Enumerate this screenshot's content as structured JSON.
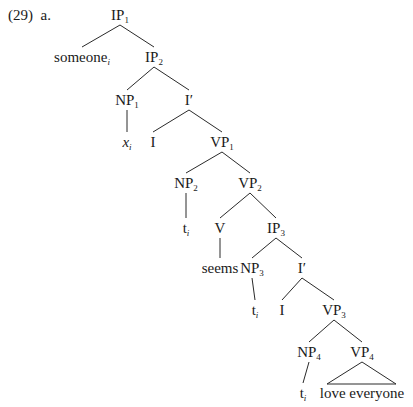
{
  "example": {
    "number": "(29)",
    "sub": "a."
  },
  "chart_data": {
    "type": "tree",
    "nodes": [
      {
        "id": "IP1",
        "cat": "IP",
        "sub": "1",
        "x": 120,
        "y": 15
      },
      {
        "id": "someone",
        "cat": "someone",
        "sub": "i",
        "sub_italic": true,
        "x": 82,
        "y": 57
      },
      {
        "id": "IP2",
        "cat": "IP",
        "sub": "2",
        "x": 154,
        "y": 57
      },
      {
        "id": "NP1",
        "cat": "NP",
        "sub": "1",
        "x": 127,
        "y": 100
      },
      {
        "id": "Ibar1",
        "cat": "I′",
        "sub": "",
        "x": 189,
        "y": 100
      },
      {
        "id": "x_i",
        "cat": "x",
        "sub": "i",
        "italic": true,
        "sub_italic": true,
        "x": 127,
        "y": 142
      },
      {
        "id": "I1",
        "cat": "I",
        "sub": "",
        "x": 153,
        "y": 142
      },
      {
        "id": "VP1",
        "cat": "VP",
        "sub": "1",
        "x": 222,
        "y": 142
      },
      {
        "id": "NP2",
        "cat": "NP",
        "sub": "2",
        "x": 186,
        "y": 183
      },
      {
        "id": "VP2",
        "cat": "VP",
        "sub": "2",
        "x": 250,
        "y": 183
      },
      {
        "id": "t1",
        "cat": "t",
        "sub": "i",
        "sub_italic": true,
        "x": 186,
        "y": 228
      },
      {
        "id": "V",
        "cat": "V",
        "sub": "",
        "x": 220,
        "y": 228
      },
      {
        "id": "IP3",
        "cat": "IP",
        "sub": "3",
        "x": 276,
        "y": 228
      },
      {
        "id": "seems",
        "cat": "seems",
        "sub": "",
        "x": 220,
        "y": 268
      },
      {
        "id": "NP3",
        "cat": "NP",
        "sub": "3",
        "x": 252,
        "y": 268
      },
      {
        "id": "Ibar2",
        "cat": "I′",
        "sub": "",
        "x": 302,
        "y": 268
      },
      {
        "id": "t2",
        "cat": "t",
        "sub": "i",
        "sub_italic": true,
        "x": 255,
        "y": 310
      },
      {
        "id": "I2",
        "cat": "I",
        "sub": "",
        "x": 282,
        "y": 310
      },
      {
        "id": "VP3",
        "cat": "VP",
        "sub": "3",
        "x": 334,
        "y": 310
      },
      {
        "id": "NP4",
        "cat": "NP",
        "sub": "4",
        "x": 309,
        "y": 352
      },
      {
        "id": "VP4",
        "cat": "VP",
        "sub": "4",
        "x": 362,
        "y": 352
      },
      {
        "id": "t3",
        "cat": "t",
        "sub": "i",
        "sub_italic": true,
        "x": 303,
        "y": 393
      },
      {
        "id": "love",
        "cat": "love everyone",
        "sub": "",
        "x": 362,
        "y": 393
      }
    ],
    "edges": [
      [
        "IP1",
        "someone"
      ],
      [
        "IP1",
        "IP2"
      ],
      [
        "IP2",
        "NP1"
      ],
      [
        "IP2",
        "Ibar1"
      ],
      [
        "NP1",
        "x_i"
      ],
      [
        "Ibar1",
        "I1"
      ],
      [
        "Ibar1",
        "VP1"
      ],
      [
        "VP1",
        "NP2"
      ],
      [
        "VP1",
        "VP2"
      ],
      [
        "NP2",
        "t1"
      ],
      [
        "VP2",
        "V"
      ],
      [
        "VP2",
        "IP3"
      ],
      [
        "V",
        "seems"
      ],
      [
        "IP3",
        "NP3"
      ],
      [
        "IP3",
        "Ibar2"
      ],
      [
        "NP3",
        "t2"
      ],
      [
        "Ibar2",
        "I2"
      ],
      [
        "Ibar2",
        "VP3"
      ],
      [
        "VP3",
        "NP4"
      ],
      [
        "VP3",
        "VP4"
      ],
      [
        "NP4",
        "t3"
      ]
    ],
    "triangles": [
      {
        "parent": "VP4",
        "apex": [
          362,
          362
        ],
        "left": [
          327,
          384
        ],
        "right": [
          396,
          384
        ],
        "text": "love everyone"
      }
    ]
  }
}
